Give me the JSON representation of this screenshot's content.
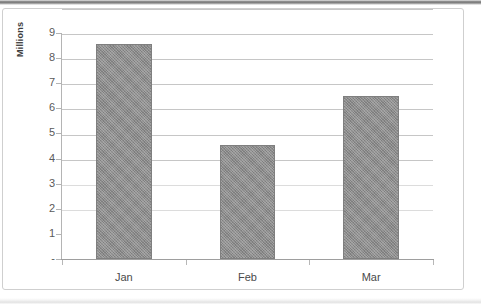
{
  "chart_data": {
    "type": "bar",
    "title": "",
    "xlabel": "",
    "ylabel": "Millions",
    "categories": [
      "Jan",
      "Feb",
      "Mar"
    ],
    "values": [
      8.55,
      4.55,
      6.5
    ],
    "ylim": [
      0,
      9
    ],
    "ytick_values": [
      9,
      8,
      7,
      6,
      5,
      4,
      3,
      2,
      1,
      0
    ],
    "ytick_labels": [
      "9",
      "8",
      "7",
      "6",
      "5",
      "4",
      "3",
      "2",
      "1",
      "-"
    ],
    "grid": true,
    "legend": "none",
    "series": [
      {
        "name": "Series 1",
        "values": [
          8.55,
          4.55,
          6.5
        ],
        "color": "#8c8c8c"
      }
    ]
  },
  "axes": {
    "y_title": "Millions"
  },
  "colors": {
    "bar_fill": "#8c8c8c",
    "bar_border": "#7f7f7f",
    "gridline": "#c6c6c6",
    "axis_line": "#9e9e9e",
    "tick_text": "#5a5a5a",
    "frame_border": "#cfcfcf",
    "background": "#ffffff"
  }
}
